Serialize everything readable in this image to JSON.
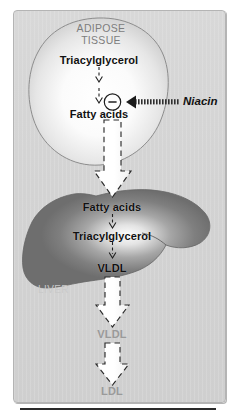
{
  "figure": {
    "panel_background": "#d3d3d3",
    "accent_dark": "#6e6e6e",
    "accent_text": "#111111"
  },
  "adipose": {
    "organ_label_line1": "ADIPOSE",
    "organ_label_line2": "TISSUE",
    "organ_label_color": "#7d7d7d",
    "substrate": "Triacylglycerol",
    "product": "Fatty acids",
    "fill_light": "#ffffff",
    "fill_edge": "#bcbcbc"
  },
  "inhibition": {
    "symbol": "−",
    "symbol_name": "minus-sign",
    "drug": "Niacin",
    "drug_style": "bold-italic"
  },
  "liver": {
    "organ_label": "LIVER",
    "organ_label_color": "#c9c9c9",
    "substrate": "Fatty acids",
    "intermediate": "Triacylglycerol",
    "product": "VLDL",
    "fill_dark": "#7a7a7a",
    "fill_highlight": "#f2f2f2"
  },
  "plasma": {
    "vldl": "VLDL",
    "ldl": "LDL",
    "label_color": "#9a9a9a"
  },
  "icons": {
    "thin_arrow": "thin-dashed-arrow-icon",
    "block_arrow": "white-block-arrow-icon",
    "inhibit_arrow": "hatched-inhibition-arrow-icon"
  }
}
